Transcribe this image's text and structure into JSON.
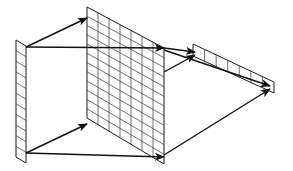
{
  "diagram": {
    "colors": {
      "stroke": "#1a1a1a",
      "background": "#ffffff"
    },
    "layers": [
      {
        "id": "input-strip",
        "corners": [
          [
            16,
            40
          ],
          [
            26,
            46
          ],
          [
            26,
            163
          ],
          [
            16,
            157
          ]
        ],
        "cols": 1,
        "rows": 11
      },
      {
        "id": "middle-grid",
        "corners": [
          [
            87,
            7
          ],
          [
            164,
            48
          ],
          [
            164,
            164
          ],
          [
            87,
            118
          ]
        ],
        "cols": 7,
        "rows": 12
      },
      {
        "id": "output-strip",
        "corners": [
          [
            193,
            44
          ],
          [
            274,
            82
          ],
          [
            274,
            93
          ],
          [
            193,
            56
          ]
        ],
        "cols": 7,
        "rows": 1
      }
    ],
    "arrows": [
      {
        "from": [
          26,
          47
        ],
        "to": [
          87,
          18
        ]
      },
      {
        "from": [
          26,
          47
        ],
        "to": [
          164,
          48
        ]
      },
      {
        "from": [
          26,
          153
        ],
        "to": [
          87,
          124
        ]
      },
      {
        "from": [
          26,
          153
        ],
        "to": [
          164,
          157
        ]
      },
      {
        "from": [
          164,
          48
        ],
        "to": [
          195,
          52
        ]
      },
      {
        "from": [
          164,
          72
        ],
        "to": [
          195,
          55
        ]
      },
      {
        "from": [
          164,
          50
        ],
        "to": [
          270,
          86
        ]
      },
      {
        "from": [
          164,
          155
        ],
        "to": [
          270,
          89
        ]
      }
    ]
  }
}
